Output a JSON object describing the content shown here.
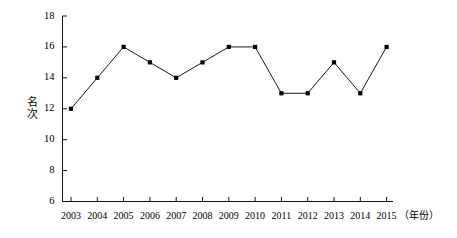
{
  "chart_data": {
    "type": "line",
    "title": "",
    "subtitle": "",
    "xlabel": "（年份）",
    "ylabel": "名次",
    "categories": [
      "2003",
      "2004",
      "2005",
      "2006",
      "2007",
      "2008",
      "2009",
      "2010",
      "2011",
      "2012",
      "2013",
      "2014",
      "2015"
    ],
    "values": [
      12,
      14,
      16,
      15,
      14,
      15,
      16,
      16,
      13,
      13,
      15,
      13,
      16
    ],
    "series": [
      {
        "name": "名次",
        "values": [
          12,
          14,
          16,
          15,
          14,
          15,
          16,
          16,
          13,
          13,
          15,
          13,
          16
        ]
      }
    ],
    "ylim": [
      6,
      18
    ],
    "ytick_labels": [
      "18",
      "16",
      "14",
      "12",
      "10",
      "8",
      "6"
    ],
    "ytick_values": [
      18,
      16,
      14,
      12,
      10,
      8,
      6
    ],
    "ytick_step": 2,
    "grid": false,
    "legend": false,
    "legend_position": "none",
    "marker": "square",
    "line_color": "#1a1a1a",
    "marker_color": "#000000",
    "axis_color": "#000000",
    "background_color": "#ffffff"
  },
  "axis": {
    "y_title_chars": [
      "名",
      "次"
    ],
    "x_note": "（年份）"
  }
}
